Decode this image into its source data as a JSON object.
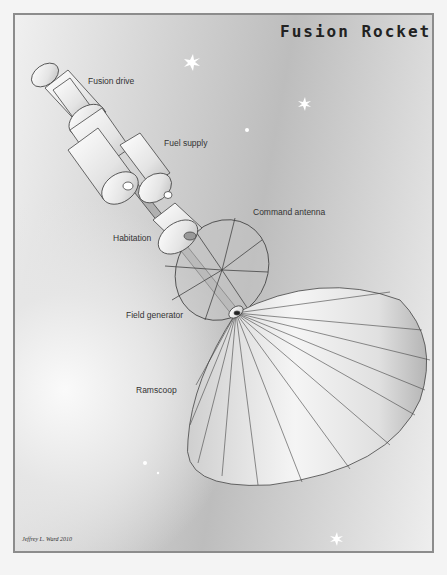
{
  "title": "Fusion Rocket",
  "labels": {
    "fusion_drive": "Fusion drive",
    "fuel_supply": "Fuel supply",
    "command_antenna": "Command antenna",
    "habitation": "Habitation",
    "field_generator": "Field generator",
    "ramscoop": "Ramscoop"
  },
  "credit": "Jeffrey L. Ward 2010",
  "colors": {
    "border": "#8c8c8c",
    "line": "#444444",
    "text": "#333333"
  }
}
